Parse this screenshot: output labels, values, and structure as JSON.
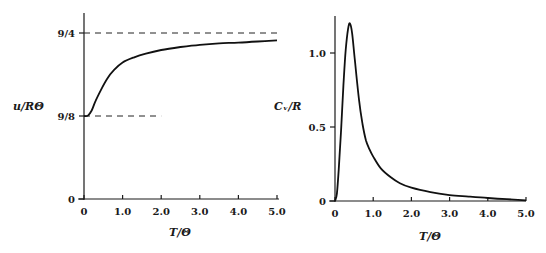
{
  "chart_data": [
    {
      "type": "line",
      "title": "",
      "xlabel": "T/Θ",
      "ylabel": "u/RΘ",
      "xlim": [
        0,
        5.0
      ],
      "ylim": [
        0,
        2.25
      ],
      "xticks": [
        "0",
        "1.0",
        "2.0",
        "3.0",
        "4.0",
        "5.0"
      ],
      "yticks": [
        {
          "label": "0",
          "value": 0
        },
        {
          "label": "9/8",
          "value": 1.125
        },
        {
          "label": "9/4",
          "value": 2.25
        }
      ],
      "grid": false,
      "reference_lines": [
        {
          "y": 2.25,
          "style": "dashed",
          "x_range": [
            0,
            5.0
          ]
        },
        {
          "y": 1.125,
          "style": "dashed",
          "x_range": [
            0,
            2.0
          ]
        }
      ],
      "series": [
        {
          "name": "u/RΘ",
          "x": [
            0,
            0.1,
            0.2,
            0.3,
            0.44,
            0.6,
            0.78,
            1.0,
            1.3,
            1.6,
            2.0,
            2.5,
            3.0,
            3.5,
            4.0,
            4.5,
            5.0
          ],
          "y": [
            1.125,
            1.13,
            1.2,
            1.33,
            1.48,
            1.63,
            1.75,
            1.85,
            1.92,
            1.97,
            2.02,
            2.06,
            2.09,
            2.11,
            2.12,
            2.135,
            2.15
          ]
        }
      ]
    },
    {
      "type": "line",
      "title": "",
      "xlabel": "T/Θ",
      "ylabel": "C_v/R",
      "xlim": [
        0,
        5.0
      ],
      "ylim": [
        0,
        1.25
      ],
      "xticks": [
        "0",
        "1.0",
        "2.0",
        "3.0",
        "4.0",
        "5.0"
      ],
      "yticks": [
        {
          "label": "0",
          "value": 0
        },
        {
          "label": "0.5",
          "value": 0.5
        },
        {
          "label": "1.0",
          "value": 1.0
        }
      ],
      "grid": false,
      "series": [
        {
          "name": "C_v/R",
          "x": [
            0,
            0.05,
            0.1,
            0.16,
            0.22,
            0.28,
            0.34,
            0.39,
            0.45,
            0.52,
            0.63,
            0.72,
            0.81,
            0.9,
            1.0,
            1.2,
            1.46,
            1.7,
            2.0,
            2.5,
            3.0,
            3.5,
            4.0,
            4.5,
            5.0
          ],
          "y": [
            0,
            0.05,
            0.22,
            0.48,
            0.78,
            1.02,
            1.16,
            1.2,
            1.13,
            0.95,
            0.68,
            0.52,
            0.41,
            0.35,
            0.3,
            0.22,
            0.16,
            0.12,
            0.09,
            0.06,
            0.04,
            0.03,
            0.02,
            0.012,
            0.005
          ]
        }
      ]
    }
  ]
}
